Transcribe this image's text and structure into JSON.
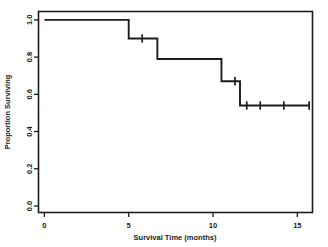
{
  "chart_data": {
    "type": "line",
    "subtype": "kaplan-meier-step",
    "title": "",
    "xlabel": "Survival Time (months)",
    "ylabel": "Proportion Surviving",
    "xlim": [
      -0.35,
      15.9
    ],
    "ylim": [
      -0.035,
      1.045
    ],
    "xticks": [
      0,
      5,
      10,
      15
    ],
    "xtick_labels": [
      "0",
      "5",
      "10",
      "15"
    ],
    "yticks": [
      0.0,
      0.2,
      0.4,
      0.6,
      0.8,
      1.0
    ],
    "ytick_labels": [
      "0.0",
      "0.2",
      "0.4",
      "0.6",
      "0.8",
      "1.0"
    ],
    "grid": false,
    "legend": false,
    "frame": true,
    "line_color": "#1c1c1c",
    "series": [
      {
        "name": "Survival",
        "step_points": [
          {
            "t": 0.0,
            "s": 1.0
          },
          {
            "t": 5.0,
            "s": 1.0
          },
          {
            "t": 5.0,
            "s": 0.9
          },
          {
            "t": 6.7,
            "s": 0.9
          },
          {
            "t": 6.7,
            "s": 0.79
          },
          {
            "t": 10.5,
            "s": 0.79
          },
          {
            "t": 10.5,
            "s": 0.67
          },
          {
            "t": 11.6,
            "s": 0.67
          },
          {
            "t": 11.6,
            "s": 0.54
          },
          {
            "t": 15.7,
            "s": 0.54
          }
        ],
        "event_times": [
          5.0,
          6.7,
          10.5,
          11.6
        ],
        "event_survival": [
          0.9,
          0.79,
          0.67,
          0.54
        ],
        "censored": [
          {
            "t": 5.8,
            "s": 0.9
          },
          {
            "t": 11.3,
            "s": 0.67
          },
          {
            "t": 12.0,
            "s": 0.54
          },
          {
            "t": 12.8,
            "s": 0.54
          },
          {
            "t": 14.2,
            "s": 0.54
          },
          {
            "t": 15.7,
            "s": 0.54
          }
        ]
      }
    ]
  }
}
